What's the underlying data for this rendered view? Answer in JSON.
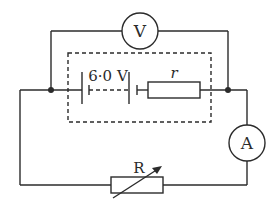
{
  "diagram": {
    "type": "circuit",
    "components": {
      "voltmeter": {
        "label": "V"
      },
      "ammeter": {
        "label": "A"
      },
      "battery": {
        "label": "6·0 V"
      },
      "internal_resistance": {
        "label": "r"
      },
      "variable_resistor": {
        "label": "R"
      }
    },
    "colors": {
      "line": "#2b2b2b",
      "background": "#ffffff"
    }
  }
}
